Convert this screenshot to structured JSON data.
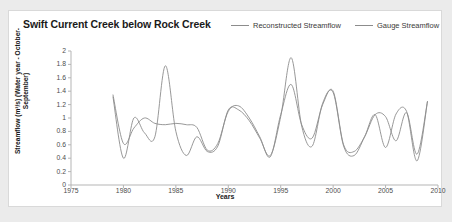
{
  "chart_title": "Swift Current Creek below Rock Creek",
  "legend": {
    "position": "top-right",
    "entries": [
      {
        "label": "Reconstructed Streamflow",
        "color": "#8c8c8c",
        "icon": "line-swatch-icon"
      },
      {
        "label": "Gauge Streamflow",
        "color": "#8c8c8c",
        "icon": "line-swatch-icon"
      }
    ]
  },
  "axes": {
    "x_title": "Years",
    "y_title": "Streamflow (m³/s) (Water year - October-September)",
    "x_tick_labels": [
      "1975",
      "1980",
      "1985",
      "1990",
      "1995",
      "2000",
      "2005",
      "2010"
    ],
    "y_tick_labels": [
      "2",
      "1.8",
      "1.6",
      "1.4",
      "1.2",
      "1",
      "0.8",
      "0.6",
      "0.4",
      "0.2",
      "0"
    ]
  },
  "colors": {
    "background": "#ebebeb",
    "card": "#ffffff",
    "card_border": "#d9d9d9",
    "axis": "#b5b5b5",
    "series_reconstructed": "#8c8c8c",
    "series_gauge": "#8c8c8c",
    "text": "#1a1a1a"
  },
  "chart_data": {
    "type": "line",
    "title": "Swift Current Creek below Rock Creek",
    "xlabel": "Years",
    "ylabel": "Streamflow (m³/s) (Water year - October-September)",
    "xlim": [
      1975,
      2010
    ],
    "ylim": [
      0,
      2
    ],
    "x_ticks": [
      1975,
      1980,
      1985,
      1990,
      1995,
      2000,
      2005,
      2010
    ],
    "y_ticks": [
      0,
      0.2,
      0.4,
      0.6,
      0.8,
      1.0,
      1.2,
      1.4,
      1.6,
      1.8,
      2.0
    ],
    "grid": false,
    "legend_position": "top-right",
    "x": [
      1979,
      1980,
      1981,
      1982,
      1983,
      1984,
      1985,
      1986,
      1987,
      1988,
      1989,
      1990,
      1991,
      1992,
      1993,
      1994,
      1995,
      1996,
      1997,
      1998,
      1999,
      2000,
      2001,
      2002,
      2003,
      2004,
      2005,
      2006,
      2007,
      2008,
      2009
    ],
    "series": [
      {
        "name": "Reconstructed Streamflow",
        "color": "#8c8c8c",
        "values": [
          1.35,
          0.62,
          0.85,
          1.0,
          0.92,
          0.9,
          0.92,
          0.9,
          0.86,
          0.52,
          0.62,
          1.1,
          1.18,
          1.0,
          0.72,
          0.42,
          1.05,
          1.5,
          0.9,
          0.7,
          1.2,
          1.4,
          0.6,
          0.5,
          0.72,
          1.05,
          1.02,
          0.66,
          1.08,
          0.46,
          1.25
        ]
      },
      {
        "name": "Gauge Streamflow",
        "color": "#8c8c8c",
        "values": [
          1.32,
          0.4,
          1.0,
          0.78,
          0.72,
          1.78,
          0.8,
          0.44,
          0.72,
          0.5,
          0.58,
          1.12,
          1.12,
          0.96,
          0.7,
          0.44,
          1.02,
          1.9,
          0.88,
          0.58,
          1.22,
          1.38,
          0.58,
          0.44,
          0.72,
          1.05,
          0.56,
          1.06,
          1.1,
          0.36,
          1.25
        ]
      }
    ]
  }
}
